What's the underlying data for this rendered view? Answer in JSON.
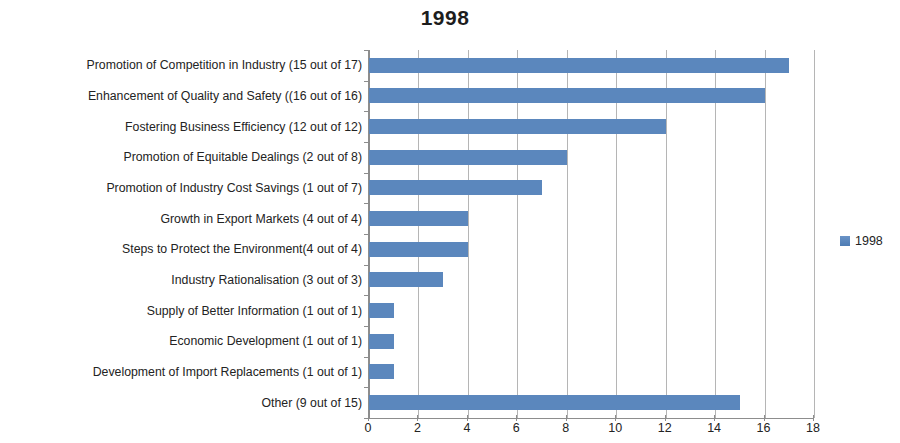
{
  "chart_data": {
    "type": "bar",
    "orientation": "horizontal",
    "title": "1998",
    "xlabel": "",
    "ylabel": "",
    "xlim": [
      0,
      18
    ],
    "xticks": [
      0,
      2,
      4,
      6,
      8,
      10,
      12,
      14,
      16,
      18
    ],
    "grid": true,
    "legend_position": "right",
    "series": [
      {
        "name": "1998",
        "color": "#5b87bd",
        "values": [
          17,
          16,
          12,
          8,
          7,
          4,
          4,
          3,
          1,
          1,
          1,
          15
        ]
      }
    ],
    "categories": [
      "Promotion of Competition in Industry (15 out of 17)",
      "Enhancement of Quality and Safety ((16 out of 16)",
      "Fostering Business Efficiency (12 out of 12)",
      "Promotion of Equitable Dealings  (2 out of 8)",
      "Promotion of Industry Cost Savings (1 out of 7)",
      "Growth in Export Markets (4 out of 4)",
      "Steps to Protect the Environment(4 out of 4)",
      "Industry Rationalisation  (3 out of 3)",
      "Supply of Better Information  (1 out of 1)",
      "Economic Development (1 out of 1)",
      "Development of Import Replacements (1 out of 1)",
      "Other (9 out of 15)"
    ]
  },
  "legend": {
    "entries": [
      {
        "label": "1998",
        "color": "#5b87bd"
      }
    ]
  }
}
